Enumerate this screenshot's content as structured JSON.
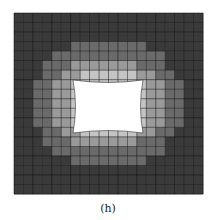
{
  "figure": {
    "caption": "(h)",
    "colors": {
      "dark": "#2a2a2a",
      "mid": "#6e6e6e",
      "light": "#bdbdbd",
      "hole": "#ffffff",
      "grid_line": "#111111"
    },
    "mesh": {
      "x0": 14,
      "y0": 13,
      "x1": 203,
      "y1": 194,
      "cols": 20,
      "rows": 19,
      "hole": {
        "x0": 73,
        "y0": 80,
        "x1": 143,
        "y1": 133,
        "bow": 5
      },
      "shade_levels": [
        "33333333333333333333",
        "33333333333333333333",
        "33333333333333333333",
        "33333322222222333333",
        "33332222222222223333",
        "33322211111112223333",
        "33322110000001122333",
        "33221100000000112233",
        "33221100000000112233",
        "33221100000000112233",
        "33221100000000112233",
        "33221100000000112233",
        "33322110000001122333",
        "33322211111112223333",
        "33332222222222223333",
        "33333322222222333333",
        "33333333333333333333",
        "33333333333333333333",
        "33333333333333333333"
      ],
      "shade_palette": [
        "#c4c4c4",
        "#9a9a9a",
        "#6a6a6a",
        "#3a3a3a"
      ]
    }
  }
}
